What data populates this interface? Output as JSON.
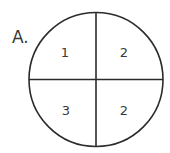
{
  "figure": {
    "label": "A.",
    "shape": "circle",
    "divisions": "four quadrants",
    "stroke_color": "#2b2b2b",
    "text_color": "#3a3a3a",
    "background_color": "#ffffff",
    "regions": [
      {
        "position": "top-left",
        "value": "1"
      },
      {
        "position": "top-right",
        "value": "2"
      },
      {
        "position": "bottom-left",
        "value": "3"
      },
      {
        "position": "bottom-right",
        "value": "2"
      }
    ]
  }
}
